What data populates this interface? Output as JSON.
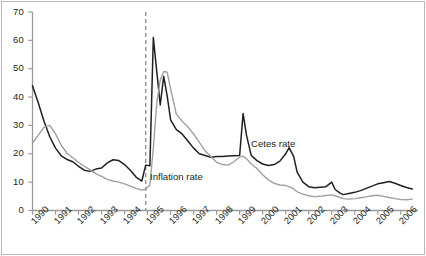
{
  "figure": {
    "border_color": "#b9b9b9",
    "background": "#ffffff"
  },
  "annotations": [
    {
      "name": "inflation-rate-label",
      "text": "Inflation rate",
      "x": 150,
      "y": 171
    },
    {
      "name": "cetes-rate-label",
      "text": "Cetes rate",
      "x": 251,
      "y": 138
    }
  ],
  "marker_line": {
    "name": "crisis-marker-line",
    "x_value": 1994.92,
    "style": "dashed",
    "color": "#8a8a8a"
  },
  "chart_data": {
    "type": "line",
    "title": "",
    "xlabel": "",
    "ylabel": "",
    "xlim": [
      1990,
      2006.75
    ],
    "ylim": [
      0,
      70
    ],
    "yticks": [
      0,
      10,
      20,
      30,
      40,
      50,
      60,
      70
    ],
    "xticks": [
      1990,
      1991,
      1992,
      1993,
      1994,
      1995,
      1996,
      1997,
      1998,
      1999,
      2000,
      2001,
      2002,
      2003,
      2004,
      2005,
      2006
    ],
    "xtick_labels": [
      "1990",
      "1991",
      "1992",
      "1993",
      "1994",
      "1995",
      "1996",
      "1997",
      "1998",
      "1999",
      "2000",
      "2001",
      "2002",
      "2003",
      "2004",
      "2005",
      "2006"
    ],
    "grid": false,
    "legend": "inline-annotations",
    "x": [
      1990.0,
      1990.25,
      1990.5,
      1990.75,
      1991.0,
      1991.25,
      1991.5,
      1991.75,
      1992.0,
      1992.25,
      1992.5,
      1992.75,
      1993.0,
      1993.25,
      1993.5,
      1993.75,
      1994.0,
      1994.25,
      1994.5,
      1994.75,
      1994.92,
      1995.1,
      1995.25,
      1995.4,
      1995.55,
      1995.7,
      1995.85,
      1996.0,
      1996.25,
      1996.5,
      1996.75,
      1997.0,
      1997.25,
      1997.5,
      1997.75,
      1998.0,
      1998.25,
      1998.5,
      1998.75,
      1999.0,
      1999.15,
      1999.3,
      1999.5,
      1999.75,
      2000.0,
      2000.25,
      2000.5,
      2000.75,
      2001.0,
      2001.15,
      2001.35,
      2001.5,
      2001.75,
      2002.0,
      2002.25,
      2002.5,
      2002.75,
      2003.0,
      2003.15,
      2003.35,
      2003.5,
      2003.75,
      2004.0,
      2004.25,
      2004.5,
      2004.75,
      2005.0,
      2005.25,
      2005.5,
      2005.75,
      2006.0,
      2006.25,
      2006.5
    ],
    "series": [
      {
        "name": "Cetes rate",
        "color": "#231f20",
        "width": 1.5,
        "values": [
          44.0,
          38.0,
          31.5,
          26.0,
          22.0,
          19.3,
          18.0,
          17.2,
          15.6,
          14.2,
          13.8,
          14.6,
          15.0,
          16.8,
          17.9,
          17.6,
          16.2,
          14.2,
          11.8,
          10.4,
          16.0,
          15.8,
          61.0,
          49.0,
          37.2,
          47.3,
          40.5,
          32.0,
          28.5,
          27.0,
          24.5,
          22.0,
          20.0,
          19.4,
          18.8,
          19.0,
          19.0,
          19.2,
          19.3,
          19.4,
          34.2,
          26.5,
          19.5,
          17.6,
          16.4,
          15.9,
          16.2,
          17.4,
          20.0,
          22.2,
          19.0,
          13.5,
          10.0,
          8.4,
          8.0,
          8.2,
          8.4,
          10.0,
          7.4,
          6.2,
          5.6,
          6.0,
          6.4,
          7.0,
          7.8,
          8.6,
          9.4,
          9.8,
          10.2,
          9.6,
          8.8,
          8.1,
          7.6
        ]
      },
      {
        "name": "Inflation rate",
        "color": "#a0a0a0",
        "width": 1.4,
        "values": [
          23.8,
          26.5,
          29.4,
          30.0,
          27.0,
          23.0,
          20.2,
          18.6,
          17.0,
          15.6,
          14.4,
          13.0,
          12.0,
          11.0,
          10.4,
          10.0,
          9.4,
          8.6,
          7.8,
          7.2,
          7.5,
          9.0,
          22.0,
          38.0,
          46.0,
          49.0,
          48.8,
          43.0,
          34.0,
          31.5,
          29.5,
          27.0,
          24.0,
          21.0,
          19.0,
          17.0,
          16.2,
          16.0,
          17.2,
          18.8,
          19.2,
          18.2,
          16.5,
          14.8,
          12.6,
          10.8,
          9.6,
          9.0,
          8.8,
          8.4,
          7.6,
          6.6,
          5.8,
          5.2,
          4.9,
          5.0,
          5.3,
          5.5,
          5.2,
          4.6,
          4.2,
          4.0,
          4.2,
          4.5,
          4.8,
          5.2,
          5.4,
          5.0,
          4.6,
          4.2,
          3.9,
          3.8,
          4.0
        ]
      }
    ]
  }
}
